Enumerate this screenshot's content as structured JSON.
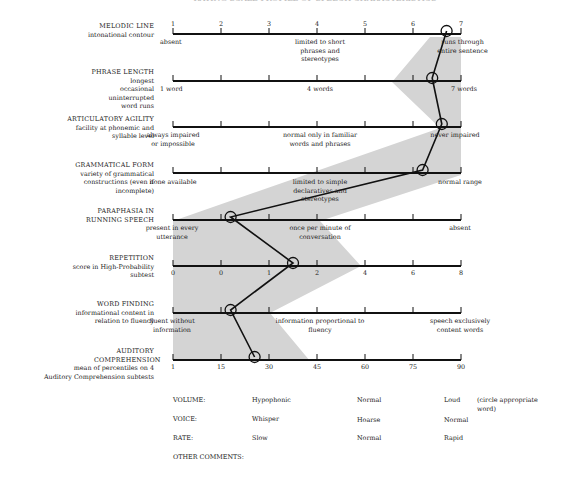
{
  "title": "RATING SCALE PROFILE OF SPEECH CHARACTERISTICS",
  "rows": [
    {
      "name": "MELODIC LINE",
      "desc": "intonational contour",
      "ticks": [
        "1",
        "2",
        "3",
        "4",
        "5",
        "6",
        "7"
      ],
      "anchors": [
        "absent",
        "limited to short phrases and stereotypes",
        "runs through entire sentence"
      ],
      "rating": 6.7
    },
    {
      "name": "PHRASE LENGTH",
      "desc": "longest occasional uninterrupted word runs",
      "ticks": [],
      "anchors": [
        "1 word",
        "4 words",
        "7 words"
      ],
      "rating": 6.4
    },
    {
      "name": "ARTICULATORY AGILITY",
      "desc": "facility at phonemic and syllable level",
      "ticks": [],
      "anchors": [
        "always impaired or impossible",
        "normal only in familiar words and phrases",
        "never impaired"
      ],
      "rating": 6.6
    },
    {
      "name": "GRAMMATICAL FORM",
      "desc": "variety of grammatical constructions (even if incomplete)",
      "ticks": [],
      "anchors": [
        "none available",
        "limited to simple declaratives and stereotypes",
        "normal range"
      ],
      "rating": 6.2
    },
    {
      "name": "PARAPHASIA IN RUNNING SPEECH",
      "desc": "",
      "ticks": [],
      "anchors": [
        "present in every utterance",
        "once per minute of conversation",
        "absent"
      ],
      "rating": 2.2
    },
    {
      "name": "REPETITION",
      "desc": "score in High-Probability subtest",
      "ticks": [
        "0",
        "0",
        "1",
        "2",
        "4",
        "6",
        "8"
      ],
      "anchors": [],
      "rating": 3.5
    },
    {
      "name": "WORD FINDING",
      "desc": "informational content in relation to fluency",
      "ticks": [],
      "anchors": [
        "fluent without information",
        "information proportional to fluency",
        "speech exclusively content words"
      ],
      "rating": 2.2
    },
    {
      "name": "AUDITORY COMPREHENSION",
      "desc": "mean of percentiles on 4 Auditory Comprehension subtests",
      "ticks": [
        "1",
        "15",
        "30",
        "45",
        "60",
        "75",
        "90"
      ],
      "anchors": [],
      "rating": 2.7
    }
  ],
  "bottom": {
    "volume": {
      "label": "VOLUME:",
      "options": [
        "Hypophonic",
        "Normal",
        "Loud"
      ]
    },
    "voice": {
      "label": "VOICE:",
      "options": [
        "Whisper",
        "Hoarse",
        "Normal"
      ]
    },
    "rate": {
      "label": "RATE:",
      "options": [
        "Slow",
        "Normal",
        "Rapid"
      ]
    },
    "note": "(circle appropriate word)",
    "other": "OTHER COMMENTS:"
  },
  "chart_data": {
    "type": "line",
    "title": "RATING SCALE PROFILE OF SPEECH CHARACTERISTICS",
    "categories": [
      "Melodic Line",
      "Phrase Length",
      "Articulatory Agility",
      "Grammatical Form",
      "Paraphasia in Running Speech",
      "Repetition",
      "Word Finding",
      "Auditory Comprehension"
    ],
    "values": [
      6.7,
      6.4,
      6.6,
      6.2,
      2.2,
      3.5,
      2.2,
      2.7
    ],
    "scale": [
      1,
      7
    ],
    "shaded_region": "gray band indicating typical range",
    "grid": false
  }
}
